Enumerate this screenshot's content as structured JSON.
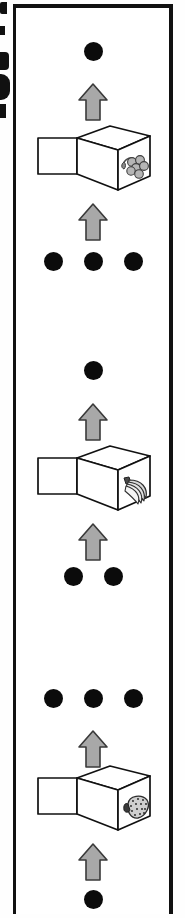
{
  "figure": {
    "type": "vertical-sequence-diagram",
    "caption_visible": false,
    "panel_border_color": "#111111",
    "background_color": "#ffffff",
    "arrow_fill_color": "#a8a8a8",
    "arrow_stroke_color": "#3a3a3a",
    "dot_color": "#0b0b0b",
    "fruit_fill_color": "#b5b5b5",
    "box_stroke_color": "#111111"
  },
  "sequences": [
    {
      "id": "sequence-top",
      "top_dots": {
        "count": 1,
        "label": "1"
      },
      "arrow_above_box": {
        "direction": "up",
        "label": "up-arrow"
      },
      "box": {
        "contents": "grapes",
        "icon": "grapes-icon",
        "label": "open box containing grapes"
      },
      "arrow_below_box": {
        "direction": "up",
        "label": "up-arrow"
      },
      "bottom_dots": {
        "count": 3,
        "label": "3"
      }
    },
    {
      "id": "sequence-middle",
      "top_dots": {
        "count": 1,
        "label": "1"
      },
      "arrow_above_box": {
        "direction": "up",
        "label": "up-arrow"
      },
      "box": {
        "contents": "bananas",
        "icon": "bananas-icon",
        "label": "open box containing bananas"
      },
      "arrow_below_box": {
        "direction": "up",
        "label": "up-arrow"
      },
      "bottom_dots": {
        "count": 2,
        "label": "2"
      }
    },
    {
      "id": "sequence-bottom",
      "top_dots": {
        "count": 3,
        "label": "3"
      },
      "arrow_above_box": {
        "direction": "up",
        "label": "up-arrow"
      },
      "box": {
        "contents": "strawberry",
        "icon": "strawberry-icon",
        "label": "open box containing a strawberry"
      },
      "arrow_below_box": {
        "direction": "up",
        "label": "up-arrow"
      },
      "bottom_dots": {
        "count": 1,
        "label": "1"
      }
    }
  ],
  "margin_marks": {
    "description": "partial ink fragments bleeding in from the adjacent page at the left edge",
    "count": 5
  }
}
